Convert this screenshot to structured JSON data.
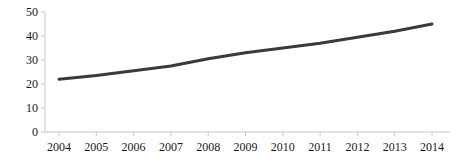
{
  "chart_data": {
    "type": "line",
    "title": "",
    "subtitle": "",
    "xlabel": "",
    "ylabel": "",
    "categories": [
      "2004",
      "2005",
      "2006",
      "2007",
      "2008",
      "2009",
      "2010",
      "2011",
      "2012",
      "2013",
      "2014"
    ],
    "x": [
      2004,
      2005,
      2006,
      2007,
      2008,
      2009,
      2010,
      2011,
      2012,
      2013,
      2014
    ],
    "values": [
      22,
      23.5,
      25.5,
      27.5,
      30.5,
      33,
      35,
      37,
      39.5,
      42,
      45
    ],
    "series": [
      {
        "name": "",
        "values": [
          22,
          23.5,
          25.5,
          27.5,
          30.5,
          33,
          35,
          37,
          39.5,
          42,
          45
        ]
      }
    ],
    "ylim": [
      0,
      50
    ],
    "xlim": [
      2004,
      2014
    ],
    "yticks": [
      0,
      10,
      20,
      30,
      40,
      50
    ],
    "ytick_labels": [
      "0",
      "10",
      "20",
      "30",
      "40",
      "50"
    ],
    "xtick_labels": [
      "2004",
      "2005",
      "2006",
      "2007",
      "2008",
      "2009",
      "2010",
      "2011",
      "2012",
      "2013",
      "2014"
    ],
    "grid": false,
    "legend": false,
    "legend_position": "none",
    "line_color": "#3a3a3a",
    "line_width": 3,
    "axis_color": "#c8c8c8",
    "tick_label_color": "#1a1a1a",
    "background_color": "#ffffff",
    "annotations": []
  }
}
